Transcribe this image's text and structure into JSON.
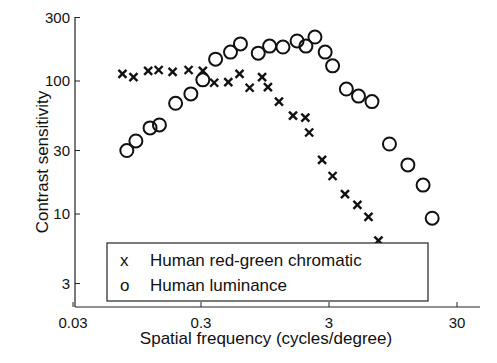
{
  "chart_data": {
    "type": "scatter",
    "title": "",
    "xlabel": "Spatial frequency (cycles/degree)",
    "ylabel": "Contrast sensitivity",
    "xscale": "log",
    "yscale": "log",
    "xlim": [
      0.03,
      50
    ],
    "ylim": [
      2,
      300
    ],
    "x_ticks": [
      0.03,
      0.3,
      3,
      30
    ],
    "x_tick_labels": [
      "0.03",
      "0.3",
      "3",
      "30"
    ],
    "y_ticks": [
      3,
      10,
      30,
      100,
      300
    ],
    "y_tick_labels": [
      "3",
      "10",
      "30",
      "100",
      "300"
    ],
    "grid": false,
    "legend_position": "lower-left inside",
    "series": [
      {
        "name": "Human red-green chromatic",
        "marker": "x",
        "legend_symbol": "x",
        "x": [
          0.073,
          0.089,
          0.116,
          0.14,
          0.18,
          0.24,
          0.31,
          0.38,
          0.49,
          0.6,
          0.72,
          0.9,
          1.0,
          1.22,
          1.57,
          1.96,
          2.1,
          2.65,
          3.2,
          4.0,
          5.0,
          6.1,
          7.3
        ],
        "values": [
          113,
          107,
          119,
          121,
          117,
          121,
          119,
          97,
          98,
          113,
          89,
          107,
          90,
          70,
          55,
          53,
          41,
          25.5,
          19.3,
          14.1,
          11.7,
          9.5,
          6.3
        ]
      },
      {
        "name": "Human luminance",
        "marker": "o",
        "legend_symbol": "o",
        "x": [
          0.079,
          0.093,
          0.12,
          0.142,
          0.19,
          0.25,
          0.31,
          0.39,
          0.51,
          0.61,
          0.84,
          1.03,
          1.31,
          1.69,
          1.98,
          2.33,
          2.8,
          3.2,
          4.1,
          5.1,
          6.5,
          8.9,
          12.4,
          16.3,
          19.2
        ],
        "values": [
          30,
          35.4,
          44.4,
          46.7,
          68,
          80,
          102,
          146,
          165,
          190,
          162,
          183,
          180,
          200,
          183,
          214,
          165,
          130,
          87,
          77,
          70,
          33.6,
          23.4,
          16.5,
          9.3
        ]
      }
    ]
  },
  "legend": {
    "items": [
      {
        "symbol": "x",
        "label": "Human red-green chromatic"
      },
      {
        "symbol": "o",
        "label": "Human luminance"
      }
    ]
  }
}
